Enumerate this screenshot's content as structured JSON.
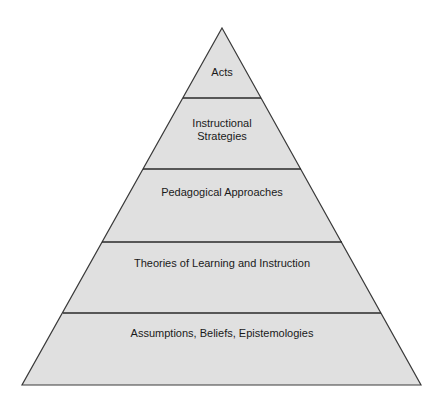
{
  "diagram": {
    "type": "pyramid",
    "colors": {
      "fill": "#e0e0e0",
      "stroke": "#3a3a3a",
      "text": "#1a1a1a",
      "background": "#ffffff"
    },
    "layers": [
      {
        "label": "Acts",
        "lines": [
          "Acts"
        ]
      },
      {
        "label": "Instructional Strategies",
        "lines": [
          "Instructional",
          "Strategies"
        ]
      },
      {
        "label": "Pedagogical Approaches",
        "lines": [
          "Pedagogical Approaches"
        ]
      },
      {
        "label": "Theories of Learning and Instruction",
        "lines": [
          "Theories of Learning and Instruction"
        ]
      },
      {
        "label": "Assumptions, Beliefs, Epistemologies",
        "lines": [
          "Assumptions, Beliefs, Epistemologies"
        ]
      }
    ]
  }
}
